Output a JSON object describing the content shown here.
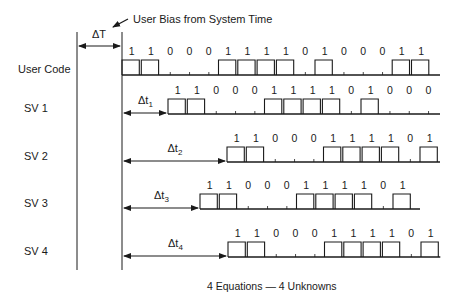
{
  "title_annotation": {
    "delta_T_label": "ΔT",
    "bias_label": "User Bias from System Time"
  },
  "rows": [
    {
      "label": "User Code",
      "delta_label": "",
      "delta_sub": "",
      "start_x": 122,
      "baseline_y": 75,
      "bits": [
        1,
        1,
        0,
        0,
        0,
        1,
        1,
        1,
        1,
        0,
        1,
        0,
        0,
        0,
        1,
        1
      ],
      "line_end_x": 440
    },
    {
      "label": "SV 1",
      "delta_label": "Δt",
      "delta_sub": "1",
      "start_x": 168,
      "baseline_y": 114,
      "bits": [
        1,
        1,
        0,
        0,
        0,
        1,
        1,
        1,
        1,
        0,
        1,
        0,
        0,
        0
      ],
      "line_end_x": 440
    },
    {
      "label": "SV 2",
      "delta_label": "Δt",
      "delta_sub": "2",
      "start_x": 227,
      "baseline_y": 162,
      "bits": [
        1,
        1,
        0,
        0,
        0,
        1,
        1,
        1,
        1,
        0,
        1
      ],
      "line_end_x": 440
    },
    {
      "label": "SV 3",
      "delta_label": "Δt",
      "delta_sub": "3",
      "start_x": 200,
      "baseline_y": 209,
      "bits": [
        1,
        1,
        0,
        0,
        0,
        1,
        1,
        1,
        1,
        0,
        1
      ],
      "line_end_x": 420
    },
    {
      "label": "SV 4",
      "delta_label": "Δt",
      "delta_sub": "4",
      "start_x": 228,
      "baseline_y": 257,
      "bits": [
        1,
        1,
        0,
        0,
        0,
        1,
        1,
        1,
        1,
        0,
        1
      ],
      "line_end_x": 440
    }
  ],
  "caption": "4 Equations — 4 Unknowns",
  "colors": {
    "line": "#1a1a1a",
    "background": "#ffffff"
  }
}
